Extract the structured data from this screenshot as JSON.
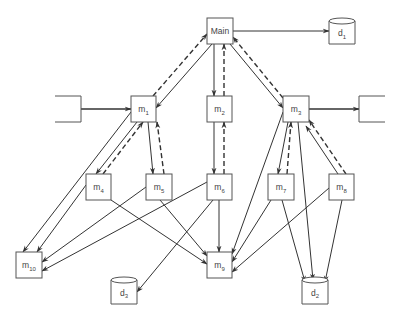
{
  "diagram": {
    "type": "structure-chart",
    "nodes": [
      {
        "id": "main",
        "label": "Main",
        "sub": "",
        "kind": "module",
        "x": 207,
        "y": 18,
        "w": 26,
        "h": 26
      },
      {
        "id": "d1",
        "label": "d",
        "sub": "1",
        "kind": "datastore",
        "x": 329,
        "y": 18,
        "w": 26,
        "h": 26
      },
      {
        "id": "in",
        "label": "",
        "sub": "",
        "kind": "open-left",
        "x": 55,
        "y": 96,
        "w": 26,
        "h": 26
      },
      {
        "id": "m1",
        "label": "m",
        "sub": "1",
        "kind": "module",
        "x": 131,
        "y": 96,
        "w": 25,
        "h": 26
      },
      {
        "id": "m2",
        "label": "m",
        "sub": "2",
        "kind": "module",
        "x": 207,
        "y": 96,
        "w": 25,
        "h": 26
      },
      {
        "id": "m3",
        "label": "m",
        "sub": "3",
        "kind": "module",
        "x": 283,
        "y": 96,
        "w": 26,
        "h": 26
      },
      {
        "id": "out",
        "label": "",
        "sub": "",
        "kind": "open-right",
        "x": 359,
        "y": 96,
        "w": 26,
        "h": 26
      },
      {
        "id": "m4",
        "label": "m",
        "sub": "4",
        "kind": "module",
        "x": 86,
        "y": 174,
        "w": 25,
        "h": 26
      },
      {
        "id": "m5",
        "label": "m",
        "sub": "5",
        "kind": "module",
        "x": 146,
        "y": 174,
        "w": 26,
        "h": 26
      },
      {
        "id": "m6",
        "label": "m",
        "sub": "6",
        "kind": "module",
        "x": 207,
        "y": 174,
        "w": 25,
        "h": 26
      },
      {
        "id": "m7",
        "label": "m",
        "sub": "7",
        "kind": "module",
        "x": 268,
        "y": 174,
        "w": 26,
        "h": 26
      },
      {
        "id": "m8",
        "label": "m",
        "sub": "8",
        "kind": "module",
        "x": 329,
        "y": 174,
        "w": 25,
        "h": 26
      },
      {
        "id": "m10",
        "label": "m",
        "sub": "10",
        "kind": "module",
        "x": 16,
        "y": 252,
        "w": 26,
        "h": 26
      },
      {
        "id": "m9",
        "label": "m",
        "sub": "9",
        "kind": "module",
        "x": 207,
        "y": 252,
        "w": 25,
        "h": 26
      },
      {
        "id": "d3",
        "label": "d",
        "sub": "3",
        "kind": "datastore",
        "x": 111,
        "y": 277,
        "w": 26,
        "h": 27
      },
      {
        "id": "d2",
        "label": "d",
        "sub": "2",
        "kind": "datastore",
        "x": 302,
        "y": 277,
        "w": 26,
        "h": 27
      }
    ],
    "edges": [
      {
        "from": "main",
        "to": "d1",
        "style": "solid",
        "p": [
          233,
          31,
          329,
          31
        ]
      },
      {
        "from": "in",
        "to": "m1",
        "style": "bold",
        "p": [
          81,
          109,
          131,
          109
        ]
      },
      {
        "from": "m3",
        "to": "out",
        "style": "bold",
        "p": [
          309,
          109,
          359,
          109
        ]
      },
      {
        "from": "main",
        "to": "m1",
        "style": "solid",
        "p": [
          212,
          44,
          156,
          108
        ]
      },
      {
        "from": "m1",
        "to": "main",
        "style": "dashed",
        "p": [
          153,
          96,
          207,
          34
        ]
      },
      {
        "from": "main",
        "to": "m2",
        "style": "solid",
        "p": [
          214,
          44,
          214,
          96
        ]
      },
      {
        "from": "m2",
        "to": "main",
        "style": "dashed",
        "p": [
          224,
          96,
          224,
          44
        ]
      },
      {
        "from": "main",
        "to": "m3",
        "style": "solid",
        "p": [
          230,
          44,
          283,
          108
        ]
      },
      {
        "from": "m3",
        "to": "main",
        "style": "dashed",
        "p": [
          283,
          98,
          233,
          37
        ]
      },
      {
        "from": "m1",
        "to": "m4",
        "style": "solid",
        "p": [
          137,
          122,
          96,
          174
        ]
      },
      {
        "from": "m4",
        "to": "m1",
        "style": "dashed",
        "p": [
          103,
          174,
          143,
          122
        ]
      },
      {
        "from": "m1",
        "to": "m5",
        "style": "solid",
        "p": [
          148,
          122,
          153,
          174
        ]
      },
      {
        "from": "m5",
        "to": "m1",
        "style": "dashed",
        "p": [
          164,
          174,
          157,
          122
        ]
      },
      {
        "from": "m1",
        "to": "m10",
        "style": "solid",
        "p": [
          131,
          112,
          23,
          252
        ]
      },
      {
        "from": "m2",
        "to": "m6",
        "style": "solid",
        "p": [
          214,
          122,
          214,
          174
        ]
      },
      {
        "from": "m6",
        "to": "m2",
        "style": "dashed",
        "p": [
          224,
          174,
          224,
          122
        ]
      },
      {
        "from": "m3",
        "to": "m7",
        "style": "solid",
        "p": [
          288,
          122,
          278,
          174
        ]
      },
      {
        "from": "m7",
        "to": "m3",
        "style": "dashed",
        "p": [
          287,
          174,
          291,
          122
        ]
      },
      {
        "from": "m3",
        "to": "m9",
        "style": "solid",
        "p": [
          283,
          112,
          232,
          254
        ]
      },
      {
        "from": "m3",
        "to": "d2",
        "style": "solid",
        "p": [
          298,
          122,
          313,
          280
        ]
      },
      {
        "from": "m8",
        "to": "m3",
        "style": "solid",
        "p": [
          338,
          174,
          306,
          126
        ]
      },
      {
        "from": "m8",
        "to": "m3",
        "style": "dashed",
        "p": [
          346,
          174,
          309,
          120
        ]
      },
      {
        "from": "m4",
        "to": "m10",
        "style": "solid",
        "p": [
          86,
          185,
          37,
          252
        ]
      },
      {
        "from": "m4",
        "to": "m9",
        "style": "solid",
        "p": [
          111,
          200,
          207,
          264
        ]
      },
      {
        "from": "m5",
        "to": "m10",
        "style": "solid",
        "p": [
          146,
          187,
          42,
          262
        ]
      },
      {
        "from": "m5",
        "to": "m9",
        "style": "solid",
        "p": [
          160,
          200,
          207,
          256
        ]
      },
      {
        "from": "m6",
        "to": "m10",
        "style": "solid",
        "p": [
          207,
          182,
          42,
          271
        ]
      },
      {
        "from": "m6",
        "to": "m9",
        "style": "solid",
        "p": [
          219,
          200,
          219,
          252
        ]
      },
      {
        "from": "m6",
        "to": "d3",
        "style": "solid",
        "p": [
          213,
          200,
          137,
          292
        ]
      },
      {
        "from": "m7",
        "to": "m9",
        "style": "solid",
        "p": [
          271,
          200,
          232,
          262
        ]
      },
      {
        "from": "m7",
        "to": "d2",
        "style": "solid",
        "p": [
          282,
          200,
          305,
          282
        ]
      },
      {
        "from": "m8",
        "to": "m9",
        "style": "solid",
        "p": [
          329,
          188,
          232,
          272
        ]
      },
      {
        "from": "m8",
        "to": "d2",
        "style": "solid",
        "p": [
          342,
          200,
          325,
          282
        ]
      }
    ]
  }
}
